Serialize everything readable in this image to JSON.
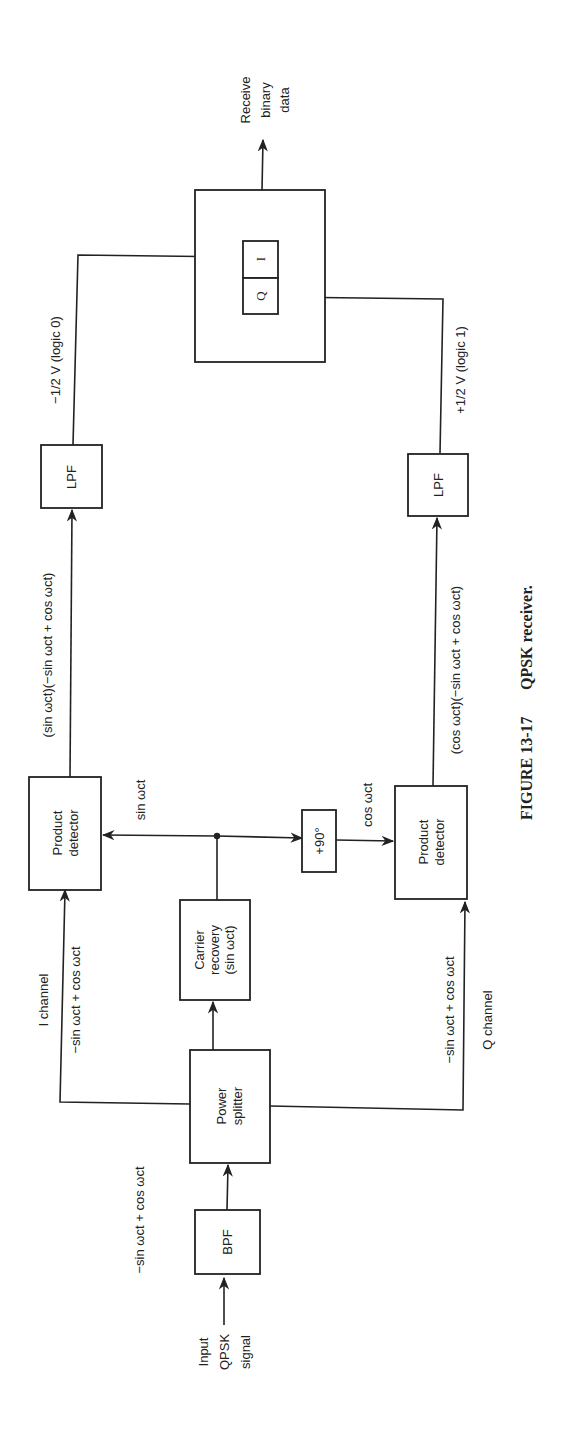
{
  "figure": {
    "caption_number": "FIGURE 13-17",
    "caption_title": "QPSK receiver."
  },
  "blocks": {
    "bpf": "BPF",
    "power_splitter": [
      "Power",
      "splitter"
    ],
    "carrier_recovery": [
      "Carrier",
      "recovery",
      "(sin ωct)"
    ],
    "product_detector_i": [
      "Product",
      "detector"
    ],
    "product_detector_q": [
      "Product",
      "detector"
    ],
    "phase_shift": "+90°",
    "lpf_i": "LPF",
    "lpf_q": "LPF",
    "decision_q": "Q",
    "decision_i": "I"
  },
  "labels": {
    "input": [
      "Input",
      "QPSK",
      "signal"
    ],
    "input_signal": "−sin ωct + cos ωct",
    "i_channel": "I channel",
    "i_signal": "−sin ωct + cos ωct",
    "q_channel": "Q channel",
    "q_signal": "−sin ωct + cos ωct",
    "sin_carrier": "sin ωct",
    "cos_carrier": "cos ωct",
    "i_product": "(sin ωct)(−sin ωct + cos ωct)",
    "q_product": "(cos ωct)(−sin ωct + cos ωct)",
    "i_output": "−1/2 V (logic 0)",
    "q_output": "+1/2 V (logic 1)",
    "output": [
      "Receive",
      "binary",
      "data"
    ]
  }
}
